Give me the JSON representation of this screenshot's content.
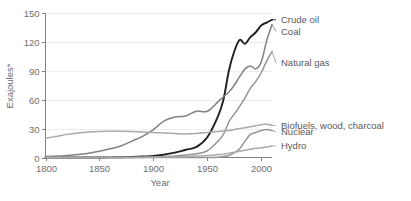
{
  "chart_data": {
    "type": "line",
    "title": "",
    "subtitle": "",
    "xlabel": "Year",
    "ylabel": "Exajoules*",
    "xlim": [
      1800,
      2010
    ],
    "ylim": [
      0,
      150
    ],
    "grid": true,
    "legend_position": "right-inline",
    "x_ticks": [
      1800,
      1850,
      1900,
      1950,
      2000
    ],
    "x_tick_labels": [
      "1800",
      "1850",
      "1900",
      "1950",
      "2000"
    ],
    "y_ticks": [
      0,
      30,
      60,
      90,
      120,
      150
    ],
    "y_tick_labels": [
      "0",
      "30",
      "60",
      "90",
      "120",
      "150"
    ],
    "x": [
      1800,
      1810,
      1820,
      1830,
      1840,
      1850,
      1860,
      1870,
      1880,
      1890,
      1900,
      1910,
      1920,
      1930,
      1940,
      1950,
      1960,
      1965,
      1970,
      1975,
      1980,
      1985,
      1990,
      1995,
      2000,
      2005,
      2010
    ],
    "series": [
      {
        "name": "Crude oil",
        "color": "#231f20",
        "width": 1.9,
        "label_y_value": 143,
        "values": [
          0,
          0,
          0,
          0,
          0,
          0,
          0.1,
          0.3,
          0.6,
          1.0,
          1.5,
          3.0,
          5.0,
          8.0,
          11.0,
          21.0,
          43.0,
          60.0,
          90.0,
          110.0,
          122.0,
          118.0,
          125.0,
          130.0,
          137.0,
          140.0,
          143.0
        ]
      },
      {
        "name": "Coal",
        "color": "#808285",
        "width": 1.5,
        "label_y_value": 131,
        "values": [
          1.0,
          1.5,
          2.0,
          3.0,
          4.5,
          6.5,
          9.0,
          12.0,
          17.0,
          22.0,
          29.0,
          38.0,
          42.0,
          43.0,
          48.0,
          48.0,
          58.0,
          63.0,
          68.0,
          75.0,
          84.0,
          92.0,
          95.0,
          92.0,
          99.0,
          121.0,
          138.0
        ]
      },
      {
        "name": "Natural gas",
        "color": "#939598",
        "width": 1.5,
        "label_y_value": 98,
        "values": [
          0,
          0,
          0,
          0,
          0,
          0,
          0,
          0,
          0.1,
          0.3,
          0.6,
          1.0,
          1.5,
          2.5,
          4.0,
          7.0,
          17.0,
          24.0,
          37.0,
          45.0,
          53.0,
          62.0,
          72.0,
          79.0,
          88.0,
          100.0,
          110.0
        ]
      },
      {
        "name": "Biofuels, wood, charcoal",
        "color": "#a7a9ac",
        "width": 1.5,
        "label_y_value": 33,
        "values": [
          20.0,
          22.0,
          24.0,
          25.5,
          26.5,
          27.0,
          27.2,
          27.3,
          27.0,
          26.5,
          26.0,
          25.5,
          25.0,
          24.5,
          25.0,
          26.0,
          27.0,
          27.5,
          28.0,
          29.0,
          30.0,
          31.0,
          32.0,
          33.0,
          34.0,
          34.5,
          33.5
        ]
      },
      {
        "name": "Nuclear",
        "color": "#939598",
        "width": 1.5,
        "label_y_value": 27,
        "values": [
          0,
          0,
          0,
          0,
          0,
          0,
          0,
          0,
          0,
          0,
          0,
          0,
          0,
          0,
          0,
          0,
          0.3,
          1.0,
          2.0,
          5.0,
          9.0,
          17.0,
          24.0,
          26.0,
          28.0,
          29.0,
          28.0
        ]
      },
      {
        "name": "Hydro",
        "color": "#a7a9ac",
        "width": 1.5,
        "label_y_value": 12,
        "values": [
          0,
          0,
          0,
          0,
          0,
          0,
          0,
          0,
          0,
          0.1,
          0.2,
          0.4,
          0.7,
          1.0,
          1.5,
          2.0,
          3.0,
          3.5,
          4.5,
          5.5,
          6.5,
          7.5,
          8.5,
          9.5,
          10.0,
          11.0,
          12.0
        ]
      }
    ]
  },
  "axis": {
    "y_title": "Exajoules*",
    "x_title": "Year"
  },
  "footnote": {
    "text": ""
  }
}
